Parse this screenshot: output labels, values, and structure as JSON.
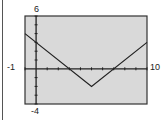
{
  "chart_data": {
    "type": "line",
    "title": "",
    "xlabel": "",
    "ylabel": "",
    "xlim": [
      -1,
      10
    ],
    "ylim": [
      -4,
      6
    ],
    "x_tick_step": 1,
    "y_tick_step": 1,
    "grid": false,
    "window_labels": {
      "xmin": "-1",
      "xmax": "10",
      "ymin": "-4",
      "ymax": "6"
    },
    "series": [
      {
        "name": "y = |x - 5| - 2",
        "x": [
          -1,
          5,
          10
        ],
        "y": [
          4,
          -2,
          3
        ]
      }
    ],
    "background": "#d9d9d9",
    "line_color": "#222222"
  }
}
